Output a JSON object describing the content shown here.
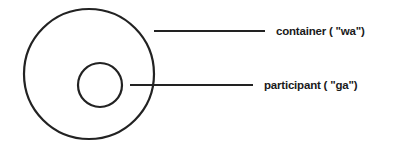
{
  "diagram": {
    "stroke_color": "#222222",
    "background": "#ffffff",
    "nodes": [
      {
        "id": "container",
        "shape": "circle",
        "cx": 89,
        "cy": 74,
        "r": 65
      },
      {
        "id": "participant",
        "shape": "circle",
        "cx": 100,
        "cy": 85,
        "r": 22
      }
    ],
    "labels": {
      "container": "container ( \"wa\")",
      "participant": "participant ( \"ga\")"
    },
    "leader_lines": [
      {
        "target": "container",
        "x1": 154,
        "y1": 31,
        "x2": 265,
        "y2": 31
      },
      {
        "target": "participant",
        "x1": 130,
        "y1": 85,
        "x2": 253,
        "y2": 85
      }
    ]
  }
}
